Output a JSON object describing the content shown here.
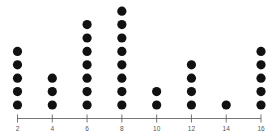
{
  "chart_data": {
    "type": "dot",
    "title": "",
    "xlabel": "",
    "ylabel": "",
    "categories": [
      "2",
      "4",
      "6",
      "8",
      "10",
      "12",
      "14",
      "16"
    ],
    "x": [
      2,
      4,
      6,
      8,
      10,
      12,
      14,
      16
    ],
    "values": [
      5,
      3,
      7,
      8,
      2,
      4,
      1,
      5
    ],
    "xlim": [
      2,
      16
    ],
    "grid": false,
    "legend": null,
    "dot_color": "#111111",
    "axis_color": "#666666"
  }
}
